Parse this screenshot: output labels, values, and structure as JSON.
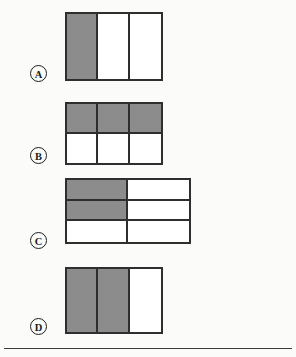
{
  "page": {
    "background_color": "#fbfbfa",
    "shaded_color": "#8c8c8c",
    "unshaded_color": "#ffffff",
    "line_color": "#2e2e2e",
    "rule_color": "#3a3a3a"
  },
  "options": [
    {
      "id": "a",
      "label": "A",
      "columns": 3,
      "rows": 1,
      "total_cells": 3,
      "shaded_cells": 1,
      "fraction_shaded": "1/3",
      "cells": [
        [
          true,
          false,
          false
        ]
      ]
    },
    {
      "id": "b",
      "label": "B",
      "columns": 3,
      "rows": 2,
      "total_cells": 6,
      "shaded_cells": 3,
      "fraction_shaded": "3/6",
      "cells": [
        [
          true,
          true,
          true
        ],
        [
          false,
          false,
          false
        ]
      ]
    },
    {
      "id": "c",
      "label": "C",
      "columns": 2,
      "rows": 3,
      "total_cells": 6,
      "shaded_cells": 2,
      "fraction_shaded": "2/6",
      "cells": [
        [
          true,
          false
        ],
        [
          true,
          false
        ],
        [
          false,
          false
        ]
      ]
    },
    {
      "id": "d",
      "label": "D",
      "columns": 3,
      "rows": 1,
      "total_cells": 3,
      "shaded_cells": 2,
      "fraction_shaded": "2/3",
      "cells": [
        [
          true,
          true,
          false
        ]
      ]
    }
  ]
}
